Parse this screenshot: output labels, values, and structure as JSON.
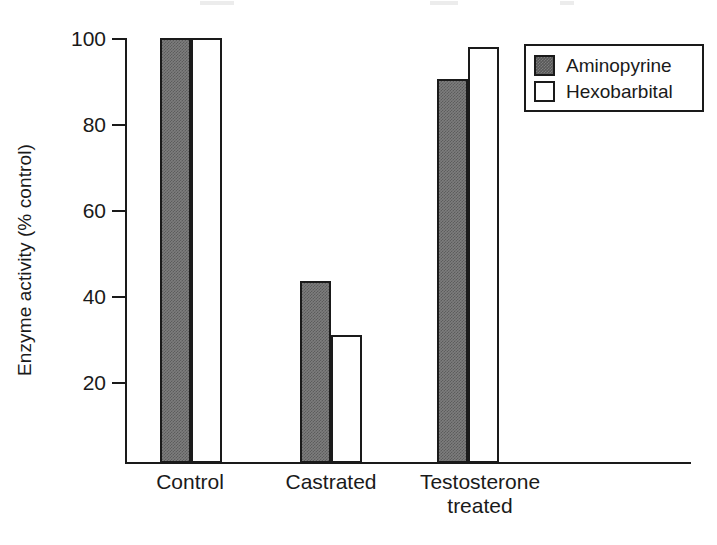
{
  "chart_data": {
    "type": "bar",
    "title": "",
    "subtitle": "",
    "xlabel": "",
    "ylabel": "Enzyme activity (% control)",
    "categories": [
      "Control",
      "Castrated",
      "Testosterone\ntreated"
    ],
    "series": [
      {
        "name": "Aminopyrine",
        "values": [
          100,
          43.5,
          90.5
        ],
        "fill": "#7d7d7d",
        "style": "filled"
      },
      {
        "name": "Hexobarbital",
        "values": [
          100,
          31.0,
          98.0
        ],
        "fill": "#ffffff",
        "style": "open"
      }
    ],
    "ylim": [
      0,
      100
    ],
    "yticks": [
      20,
      40,
      60,
      80,
      100
    ],
    "ytick_labels": [
      "20",
      "40",
      "60",
      "80",
      "100"
    ],
    "grid": false,
    "legend_position": "top-right",
    "legend_entries": [
      "Aminopyrine",
      "Hexobarbital"
    ],
    "axis_color": "#1a1a1a",
    "background": "#ffffff"
  },
  "axis": {
    "ylabel": "Enzyme activity (% control)",
    "ticks": [
      {
        "label": "100",
        "value": 100
      },
      {
        "label": "80",
        "value": 80
      },
      {
        "label": "60",
        "value": 60
      },
      {
        "label": "40",
        "value": 40
      },
      {
        "label": "20",
        "value": 20
      }
    ]
  },
  "categories": [
    {
      "label": "Control"
    },
    {
      "label": "Castrated"
    },
    {
      "label": "Testosterone\ntreated"
    }
  ],
  "legend": {
    "items": [
      {
        "label": "Aminopyrine",
        "swatch": "filled"
      },
      {
        "label": "Hexobarbital",
        "swatch": "open"
      }
    ]
  }
}
